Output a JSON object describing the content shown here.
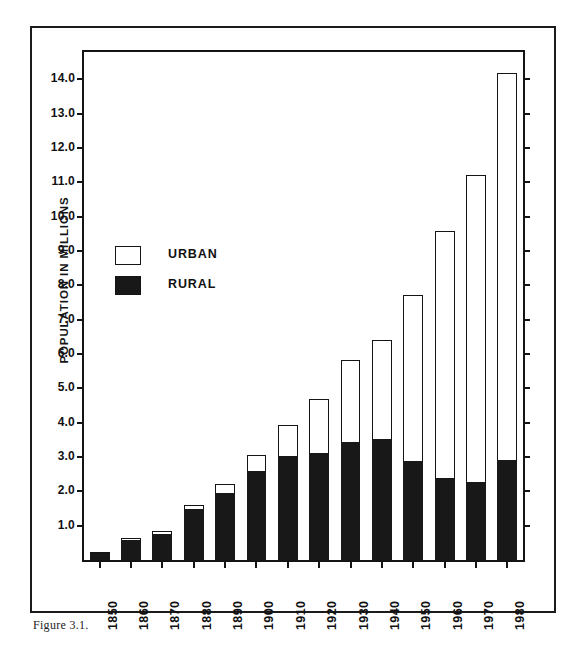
{
  "figure": {
    "caption": "Figure 3.1."
  },
  "chart_data": {
    "type": "bar",
    "subtype": "stacked-vertical",
    "title": "POPULATION GROWTH IN TEXAS:",
    "subtitle": "1850 - 1980",
    "xlabel": "",
    "ylabel": "POPULATION IN MILLIONS",
    "ylim": [
      0,
      14.8
    ],
    "ytick_values": [
      1.0,
      2.0,
      3.0,
      4.0,
      5.0,
      6.0,
      7.0,
      8.0,
      9.0,
      10.0,
      11.0,
      12.0,
      13.0,
      14.0
    ],
    "ytick_labels": [
      "1.0",
      "2.0",
      "3.0",
      "4.0",
      "5.0",
      "6.0",
      "7.0",
      "8.0",
      "9.0",
      "10.0",
      "11.0",
      "12.0",
      "13.0",
      "14.0"
    ],
    "grid": false,
    "legend_position": "upper-left-inside",
    "categories": [
      "1850",
      "1860",
      "1870",
      "1880",
      "1890",
      "1900",
      "1910",
      "1920",
      "1930",
      "1940",
      "1950",
      "1960",
      "1970",
      "1980"
    ],
    "series": [
      {
        "name": "RURAL",
        "color": "#181818",
        "values": [
          0.19,
          0.58,
          0.76,
          1.48,
          1.95,
          2.6,
          3.03,
          3.13,
          3.45,
          3.52,
          2.88,
          2.4,
          2.28,
          2.9
        ]
      },
      {
        "name": "URBAN",
        "color": "#ffffff",
        "values": [
          0.03,
          0.06,
          0.09,
          0.12,
          0.27,
          0.45,
          0.89,
          1.57,
          2.37,
          2.9,
          4.83,
          7.18,
          8.94,
          11.3
        ]
      }
    ],
    "totals": [
      0.22,
      0.64,
      0.85,
      1.6,
      2.22,
      3.05,
      3.92,
      4.7,
      5.82,
      6.42,
      7.71,
      9.58,
      11.22,
      14.2
    ]
  },
  "legend": {
    "items": [
      {
        "label": "URBAN",
        "swatch": "hollow"
      },
      {
        "label": "RURAL",
        "swatch": "filled"
      }
    ]
  }
}
